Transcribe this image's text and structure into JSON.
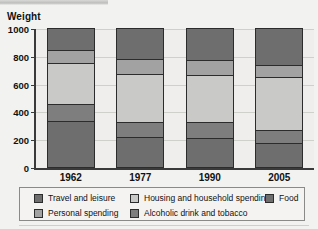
{
  "chart_data": {
    "type": "bar",
    "subtype": "stacked-bar",
    "title": "",
    "axis_title": "Weight",
    "xlabel": "",
    "ylabel": "Weight",
    "categories": [
      "1962",
      "1977",
      "1990",
      "2005"
    ],
    "ylim": [
      0,
      1000
    ],
    "yticks": [
      0,
      200,
      400,
      600,
      800,
      1000
    ],
    "ytick_labels": [
      "0",
      "200",
      "400",
      "600",
      "800",
      "1000"
    ],
    "grid": true,
    "legend_position": "bottom",
    "stack_order_bottom_to_top": [
      "Food",
      "Alcoholic drink and tobacco",
      "Housing and household spending",
      "Personal spending",
      "Travel and leisure"
    ],
    "series": [
      {
        "name": "Food",
        "color": "#6e6e6e",
        "values": [
          330,
          215,
          210,
          170
        ]
      },
      {
        "name": "Alcoholic drink and tobacco",
        "color": "#7e7e7e",
        "values": [
          120,
          110,
          115,
          95
        ]
      },
      {
        "name": "Housing and household spending",
        "color": "#c9c9c7",
        "values": [
          295,
          345,
          340,
          385
        ]
      },
      {
        "name": "Personal spending",
        "color": "#a2a2a2",
        "values": [
          100,
          105,
          105,
          85
        ]
      },
      {
        "name": "Travel and leisure",
        "color": "#6e6e6e",
        "values": [
          155,
          225,
          230,
          265
        ]
      }
    ],
    "cumulative_tops": {
      "1962": [
        330,
        450,
        745,
        845,
        1000
      ],
      "1977": [
        215,
        325,
        670,
        775,
        1000
      ],
      "1990": [
        210,
        325,
        665,
        770,
        1000
      ],
      "2005": [
        170,
        265,
        650,
        735,
        1000
      ]
    },
    "totals": [
      1000,
      1000,
      1000,
      1000
    ]
  },
  "legend": {
    "items": [
      {
        "label": "Travel and leisure",
        "color": "#6e6e6e"
      },
      {
        "label": "Housing and household spending",
        "color": "#c9c9c7"
      },
      {
        "label": "Food",
        "color": "#6e6e6e"
      },
      {
        "label": "Personal spending",
        "color": "#a2a2a2"
      },
      {
        "label": "Alcoholic drink and tobacco",
        "color": "#7e7e7e"
      }
    ]
  }
}
